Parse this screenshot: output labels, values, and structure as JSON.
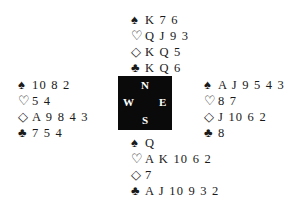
{
  "hands": {
    "north": {
      "spades": "K 7 6",
      "hearts": "Q J 9 3",
      "diamonds": "K Q 5",
      "clubs": "K Q 6"
    },
    "west": {
      "spades": "10 8 2",
      "hearts": "5 4",
      "diamonds": "A 9 8 4 3",
      "clubs": "7 5 4"
    },
    "east": {
      "spades": "A J 9 5 4 3",
      "hearts": "8 7",
      "diamonds": "J 10 6 2",
      "clubs": "8"
    },
    "south": {
      "spades": "Q",
      "hearts": "A K 10 6 2",
      "diamonds": "7",
      "clubs": "A J 10 9 3 2"
    }
  },
  "suits": {
    "spades": "♠",
    "hearts": "♡",
    "diamonds": "◇",
    "clubs": "♣"
  },
  "compass": {
    "n": "N",
    "s": "S",
    "w": "W",
    "e": "E"
  }
}
